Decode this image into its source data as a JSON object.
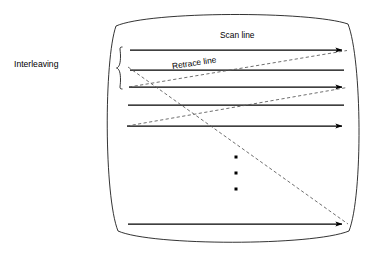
{
  "figure": {
    "kind": "crt-raster-scan-diagram",
    "background_color": "#ffffff",
    "stroke_color": "#000000",
    "dashed_stroke_color": "#555555"
  },
  "labels": {
    "interleaving": "Interleaving",
    "scan_line": "Scan line",
    "retrace_line": "Retrace line"
  },
  "screen_outline": {
    "name": "crt-screen-bezel",
    "top_center_y": 12,
    "bottom_center_y": 245,
    "left_center_x": 103,
    "right_center_x": 363,
    "corner_top_left": [
      116,
      26
    ],
    "corner_top_right": [
      348,
      24
    ],
    "corner_bottom_left": [
      118,
      231
    ],
    "corner_bottom_right": [
      349,
      231
    ]
  },
  "brace": {
    "name": "interleaving-brace",
    "x": 117,
    "y_top": 47,
    "y_bottom": 89
  },
  "scan_lines": [
    {
      "index": 1,
      "x1": 130,
      "x2": 348,
      "y": 50,
      "arrow": true
    },
    {
      "index": 2,
      "x1": 130,
      "x2": 344,
      "y": 70,
      "arrow": false
    },
    {
      "index": 3,
      "x1": 129,
      "x2": 348,
      "y": 87,
      "arrow": true
    },
    {
      "index": 4,
      "x1": 128,
      "x2": 344,
      "y": 105,
      "arrow": false
    },
    {
      "index": 5,
      "x1": 127,
      "x2": 348,
      "y": 126,
      "arrow": true
    },
    {
      "index": 6,
      "x1": 128,
      "x2": 348,
      "y": 224,
      "arrow": true
    }
  ],
  "retrace_lines": [
    {
      "name": "retrace-1",
      "x1": 129,
      "y1": 87,
      "x2": 347,
      "y2": 50
    },
    {
      "name": "retrace-2",
      "x1": 127,
      "y1": 126,
      "x2": 347,
      "y2": 87
    },
    {
      "name": "retrace-long",
      "x1": 128,
      "y1": 67,
      "x2": 348,
      "y2": 224
    }
  ],
  "ellipsis_dots": [
    {
      "cx": 236,
      "cy": 157
    },
    {
      "cx": 236,
      "cy": 173
    },
    {
      "cx": 236,
      "cy": 189
    }
  ]
}
